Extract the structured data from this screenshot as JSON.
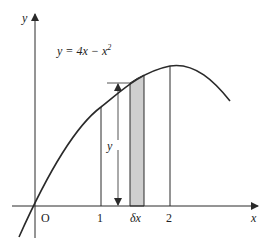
{
  "diagram": {
    "equation": "y = 4x − x²",
    "equation_parts": {
      "lhs": "y = 4",
      "x1": "x",
      "minus": " − ",
      "x2": "x",
      "exp": "2"
    },
    "axes": {
      "x_label": "x",
      "y_label": "y",
      "origin_label": "O"
    },
    "ticks": [
      {
        "label": "1"
      },
      {
        "label": "2"
      }
    ],
    "strip": {
      "label": "δx",
      "delta": "δ",
      "var": "x",
      "fill": "#cfcfcf"
    },
    "height_label": "y",
    "colors": {
      "line": "#2a2a2a",
      "strip": "#cfcfcf",
      "background": "#ffffff"
    }
  }
}
